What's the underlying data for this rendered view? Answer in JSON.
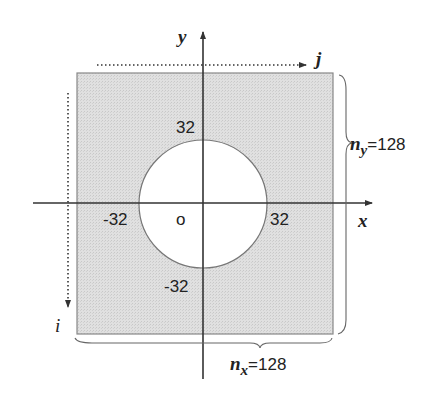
{
  "diagram": {
    "colors": {
      "fill": "#dcdcdc",
      "hole": "#ffffff",
      "stroke": "#333333",
      "border": "#888888"
    },
    "axes": {
      "x_label": "x",
      "y_label": "y"
    },
    "indices": {
      "i_label": "i",
      "j_label": "j"
    },
    "ticks": {
      "top": "32",
      "bottom": "-32",
      "left": "-32",
      "right": "32",
      "origin": "o"
    },
    "dimensions": {
      "ny_var": "n",
      "ny_sub": "y",
      "ny_value": "=128",
      "nx_var": "n",
      "nx_sub": "x",
      "nx_value": "=128"
    }
  }
}
